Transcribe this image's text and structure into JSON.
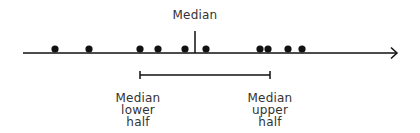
{
  "diagram": {
    "type": "number-line-median",
    "colors": {
      "ink": "#111111",
      "text": "#333333",
      "background": "#ffffff"
    },
    "axis": {
      "x_start": 23,
      "x_end": 398,
      "y": 53,
      "arrow": "right"
    },
    "points": [
      {
        "x": 55
      },
      {
        "x": 89
      },
      {
        "x": 140
      },
      {
        "x": 158
      },
      {
        "x": 185
      },
      {
        "x": 206
      },
      {
        "x": 260
      },
      {
        "x": 268
      },
      {
        "x": 288
      },
      {
        "x": 302
      }
    ],
    "median_marker": {
      "x": 195,
      "label": "Median"
    },
    "bracket": {
      "x_start": 140,
      "x_end": 270,
      "y": 75
    },
    "labels": {
      "median": "Median",
      "lower": {
        "line1": "Median",
        "line2": "lower",
        "line3": "half"
      },
      "upper": {
        "line1": "Median",
        "line2": "upper",
        "line3": "half"
      }
    }
  }
}
